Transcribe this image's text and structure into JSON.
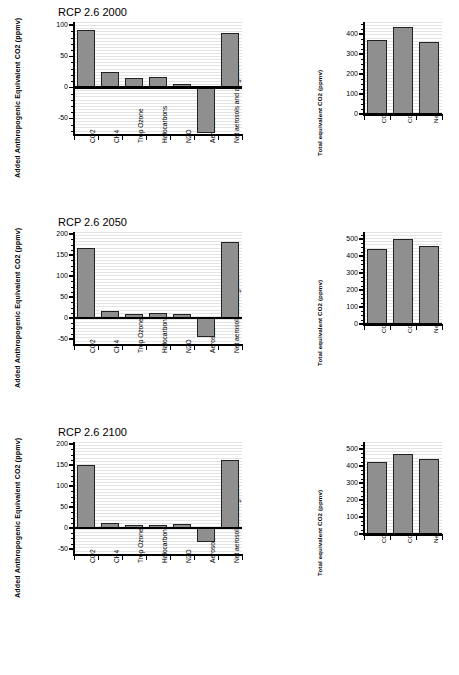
{
  "figure": {
    "background": "#ffffff",
    "bar_fill": "#8f8f8f",
    "bar_stroke": "#222222",
    "grid_color": "#e3e3e3"
  },
  "chart_data": [
    {
      "type": "bar",
      "title": "RCP 2.6 2000",
      "panel": "left",
      "xlabel": "",
      "ylabel": "Added Anthropogenic  Equivalent CO2 (ppmv)",
      "ylim": [
        -75,
        105
      ],
      "yticks": [
        -50,
        0,
        50,
        100
      ],
      "ytick_labels": [
        "-50",
        "0",
        "50",
        "100"
      ],
      "grid": true,
      "categories": [
        "CO2",
        "CH4",
        "Trop Ozone",
        "Halocarbons",
        "N2O",
        "Aerosols",
        "Net aerosols and all gases"
      ],
      "values": [
        92,
        25,
        15,
        16,
        5,
        -73,
        88
      ]
    },
    {
      "type": "bar",
      "title": "",
      "panel": "right",
      "xlabel": "",
      "ylabel": "Total equivalent CO2 (ppmv)",
      "ylim": [
        0,
        460
      ],
      "yticks": [
        0,
        100,
        200,
        300,
        400
      ],
      "ytick_labels": [
        "0",
        "100",
        "200",
        "300",
        "400"
      ],
      "grid": true,
      "categories": [
        "CO2",
        "CO2+other gases",
        "Net aerosols and all gases"
      ],
      "values": [
        370,
        435,
        360
      ]
    },
    {
      "type": "bar",
      "title": "RCP 2.6 2050",
      "panel": "left",
      "xlabel": "",
      "ylabel": "Added Anthropogenic  Equivalent CO2 (ppmv)",
      "ylim": [
        -62,
        205
      ],
      "yticks": [
        -50,
        0,
        50,
        100,
        150,
        200
      ],
      "ytick_labels": [
        "-50",
        "0",
        "50",
        "100",
        "150",
        "200"
      ],
      "grid": true,
      "categories": [
        "CO2",
        "CH4",
        "Trop Ozone",
        "Halocarbons",
        "N2O",
        "Aerosols",
        "Net aerosols and all gases"
      ],
      "values": [
        168,
        17,
        10,
        12,
        9,
        -46,
        182
      ]
    },
    {
      "type": "bar",
      "title": "",
      "panel": "right",
      "xlabel": "",
      "ylabel": "Total equivalent CO2 (ppmv)",
      "ylim": [
        0,
        540
      ],
      "yticks": [
        0,
        100,
        200,
        300,
        400,
        500
      ],
      "ytick_labels": [
        "0",
        "100",
        "200",
        "300",
        "400",
        "500"
      ],
      "grid": true,
      "categories": [
        "CO2",
        "CO2+other gases",
        "Net aerosols and all gases"
      ],
      "values": [
        440,
        500,
        455
      ]
    },
    {
      "type": "bar",
      "title": "RCP 2.6 2100",
      "panel": "left",
      "xlabel": "",
      "ylabel": "Added Anthropogenic  Equivalent CO2 (ppmv)",
      "ylim": [
        -62,
        205
      ],
      "yticks": [
        -50,
        0,
        50,
        100,
        150,
        200
      ],
      "ytick_labels": [
        "-50",
        "0",
        "50",
        "100",
        "150",
        "200"
      ],
      "grid": true,
      "categories": [
        "CO2",
        "CH4",
        "Trop Ozone",
        "Halocarbons",
        "N2O",
        "Aerosols",
        "Net aerosols and all gases"
      ],
      "values": [
        149,
        12,
        6,
        8,
        9,
        -34,
        162
      ]
    },
    {
      "type": "bar",
      "title": "",
      "panel": "right",
      "xlabel": "",
      "ylabel": "Total equivalent CO2 (ppmv)",
      "ylim": [
        0,
        540
      ],
      "yticks": [
        0,
        100,
        200,
        300,
        400,
        500
      ],
      "ytick_labels": [
        "0",
        "100",
        "200",
        "300",
        "400",
        "500"
      ],
      "grid": true,
      "categories": [
        "CO2",
        "CO2+other gases",
        "Net aerosols and all gases"
      ],
      "values": [
        420,
        470,
        440
      ]
    }
  ]
}
